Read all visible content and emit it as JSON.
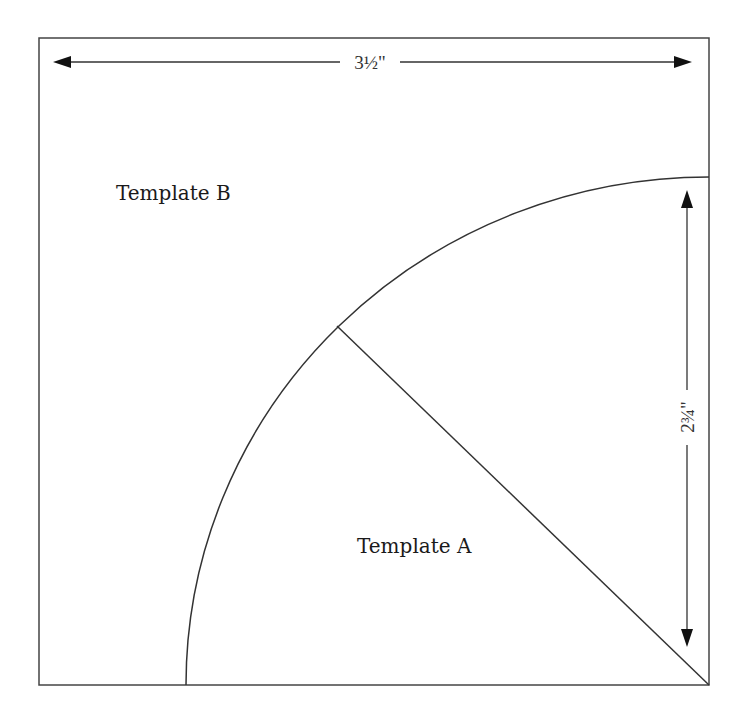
{
  "diagram": {
    "type": "quilt-template",
    "labels": {
      "template_a": "Template A",
      "template_b": "Template B"
    },
    "dimensions": {
      "width": "3½\"",
      "height": "2¾\""
    },
    "colors": {
      "line": "#333333",
      "text": "#1a1a1a",
      "background": "#ffffff"
    }
  }
}
